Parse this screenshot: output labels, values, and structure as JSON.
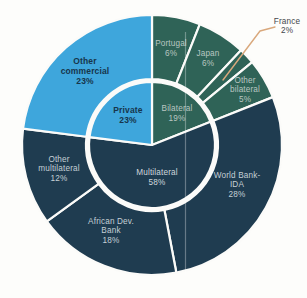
{
  "page": {
    "background_color": "#FDFDFB",
    "figure_type": "scanned sunburst chart, no title visible"
  },
  "chart_data": {
    "type": "pie",
    "subtype": "sunburst",
    "title": "",
    "units": "percent",
    "direction": "clockwise",
    "start_angle_deg": 0,
    "center": [
      152,
      145
    ],
    "radii": {
      "inner_pie": 63,
      "ring_inner": 66,
      "ring_outer": 130,
      "divider_circle": 64.5,
      "divider_width": 3
    },
    "colors": {
      "private": "#3EA6DC",
      "bilateral": "#2F6357",
      "multilateral": "#1F3C50",
      "stroke": "#FBFBF9",
      "callout_line": "#D9A87C",
      "scan_artifact": "rgba(255,255,255,0.32)"
    },
    "inner_ring": [
      {
        "id": "bilateral",
        "label": "Bilateral",
        "value": 19,
        "group": "bilateral",
        "label_lines": [
          "Bilateral",
          "19%"
        ],
        "label_pos": [
          177,
          108
        ],
        "line_spacing": 10,
        "text_color": "#B9C6C1",
        "bold": false
      },
      {
        "id": "multilateral",
        "label": "Multilateral",
        "value": 58,
        "group": "multilateral",
        "label_lines": [
          "Multilateral",
          "58%"
        ],
        "label_pos": [
          157,
          172
        ],
        "line_spacing": 10,
        "text_color": "#CFD8DD",
        "bold": false
      },
      {
        "id": "private",
        "label": "Private",
        "value": 23,
        "group": "private",
        "label_lines": [
          "Private",
          "23%"
        ],
        "label_pos": [
          128,
          110
        ],
        "line_spacing": 10,
        "text_color": "#17354B",
        "bold": true
      }
    ],
    "outer_ring": [
      {
        "id": "portugal",
        "label": "Portugal",
        "value": 6,
        "group": "bilateral",
        "label_lines": [
          "Portugal",
          "6%"
        ],
        "label_pos": [
          171,
          43
        ],
        "line_spacing": 10,
        "text_color": "#B9C6C1",
        "bold": false
      },
      {
        "id": "japan",
        "label": "Japan",
        "value": 6,
        "group": "bilateral",
        "label_lines": [
          "Japan",
          "6%"
        ],
        "label_pos": [
          208,
          53
        ],
        "line_spacing": 10,
        "text_color": "#B9C6C1",
        "bold": false
      },
      {
        "id": "france",
        "label": "France",
        "value": 2,
        "group": "bilateral",
        "label_lines": [
          "France",
          "2%"
        ],
        "label_pos": [
          287,
          21
        ],
        "line_spacing": 9.5,
        "text_color": "#44474B",
        "bold": false,
        "external": true
      },
      {
        "id": "other-bilateral",
        "label": "Other bilateral",
        "value": 5,
        "group": "bilateral",
        "label_lines": [
          "Other",
          "bilateral",
          "5%"
        ],
        "label_pos": [
          245,
          80
        ],
        "line_spacing": 9.5,
        "text_color": "#B9C6C1",
        "bold": false
      },
      {
        "id": "world-bank-ida",
        "label": "World Bank-IDA",
        "value": 28,
        "group": "multilateral",
        "label_lines": [
          "World Bank-",
          "IDA",
          "28%"
        ],
        "label_pos": [
          237,
          175
        ],
        "line_spacing": 9.5,
        "text_color": "#C4CFD5",
        "bold": false
      },
      {
        "id": "african-dev-bank",
        "label": "African Dev. Bank",
        "value": 18,
        "group": "multilateral",
        "label_lines": [
          "African Dev.",
          "Bank",
          "18%"
        ],
        "label_pos": [
          111,
          221
        ],
        "line_spacing": 9.5,
        "text_color": "#C4CFD5",
        "bold": false
      },
      {
        "id": "other-multilateral",
        "label": "Other multilateral",
        "value": 12,
        "group": "multilateral",
        "label_lines": [
          "Other",
          "multilateral",
          "12%"
        ],
        "label_pos": [
          59,
          159
        ],
        "line_spacing": 9.5,
        "text_color": "#C4CFD5",
        "bold": false
      },
      {
        "id": "other-commercial",
        "label": "Other commercial",
        "value": 23,
        "group": "private",
        "label_lines": [
          "Other",
          "commercial",
          "23%"
        ],
        "label_pos": [
          85,
          61
        ],
        "line_spacing": 10,
        "text_color": "#17354B",
        "bold": true
      }
    ],
    "callout": {
      "for": "france",
      "points": "275,27 260,31 223,80",
      "stroke_width": 1.4
    },
    "scan_artifact_line": {
      "x": 185.5,
      "y1": 32,
      "y2": 276,
      "width": 1.2
    }
  }
}
